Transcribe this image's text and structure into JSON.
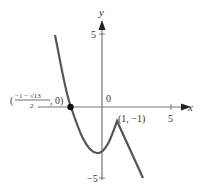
{
  "graph": {
    "axes": {
      "x_label": "x",
      "y_label": "y",
      "origin_label": "0",
      "x_tick_label": "5",
      "y_tick_top_label": "5",
      "y_tick_bottom_label": "−5"
    },
    "annotations": {
      "root_point": {
        "open_paren": "(",
        "numerator": "−1 − √13",
        "denominator": "2",
        "rest": ", 0)"
      },
      "cusp_point": "(1, −1)"
    },
    "colors": {
      "curve": "#555555",
      "axis": "#666666",
      "dot": "#111111"
    }
  }
}
